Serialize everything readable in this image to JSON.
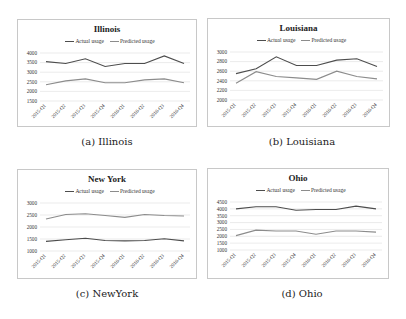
{
  "captions": {
    "a": "(a) Illinois",
    "b": "(b) Louisiana",
    "c": "(c) NewYork",
    "d": "(d) Ohio"
  },
  "legend": {
    "actual": "Actual usage",
    "predicted": "Predicted usage"
  },
  "colors": {
    "actual": "#4d4d4d",
    "predicted": "#8c8c8c",
    "grid": "#dddddd",
    "border": "#c8c8c8"
  },
  "chart_data": [
    {
      "type": "line",
      "title": "Illinois",
      "categories": [
        "2015-Q1",
        "2015-Q2",
        "2015-Q3",
        "2015-Q4",
        "2016-Q1",
        "2016-Q2",
        "2016-Q3",
        "2016-Q4"
      ],
      "series": [
        {
          "name": "Actual usage",
          "values": [
            3550,
            3450,
            3700,
            3300,
            3450,
            3450,
            3850,
            3450
          ]
        },
        {
          "name": "Predicted usage",
          "values": [
            2350,
            2550,
            2650,
            2450,
            2450,
            2600,
            2650,
            2450
          ]
        }
      ],
      "yticks": [
        1500,
        2000,
        2500,
        3000,
        3500,
        4000
      ],
      "ylim": [
        1500,
        4000
      ],
      "xlabel": "",
      "ylabel": "",
      "grid": true,
      "legend_position": "top"
    },
    {
      "type": "line",
      "title": "Louisiana",
      "categories": [
        "2015-Q1",
        "2015-Q2",
        "2015-Q3",
        "2015-Q4",
        "2016-Q1",
        "2016-Q2",
        "2016-Q3",
        "2016-Q4"
      ],
      "series": [
        {
          "name": "Actual usage",
          "values": [
            2550,
            2650,
            2900,
            2720,
            2720,
            2830,
            2860,
            2700
          ]
        },
        {
          "name": "Predicted usage",
          "values": [
            2350,
            2590,
            2490,
            2460,
            2430,
            2600,
            2490,
            2440
          ]
        }
      ],
      "yticks": [
        2000,
        2200,
        2400,
        2600,
        2800,
        3000
      ],
      "ylim": [
        2000,
        3000
      ],
      "xlabel": "",
      "ylabel": "",
      "grid": true,
      "legend_position": "top"
    },
    {
      "type": "line",
      "title": "New York",
      "categories": [
        "2015-Q1",
        "2015-Q2",
        "2015-Q3",
        "2015-Q4",
        "2016-Q1",
        "2016-Q2",
        "2016-Q3",
        "2016-Q4"
      ],
      "series": [
        {
          "name": "Actual usage",
          "values": [
            1400,
            1470,
            1530,
            1440,
            1420,
            1440,
            1510,
            1420
          ]
        },
        {
          "name": "Predicted usage",
          "values": [
            2330,
            2520,
            2550,
            2480,
            2400,
            2520,
            2480,
            2460
          ]
        }
      ],
      "yticks": [
        1000,
        1500,
        2000,
        2500,
        3000
      ],
      "ylim": [
        1000,
        3000
      ],
      "xlabel": "",
      "ylabel": "",
      "grid": true,
      "legend_position": "top"
    },
    {
      "type": "line",
      "title": "Ohio",
      "categories": [
        "2015-Q1",
        "2015-Q2",
        "2015-Q3",
        "2015-Q4",
        "2016-Q1",
        "2016-Q2",
        "2016-Q3",
        "2016-Q4"
      ],
      "series": [
        {
          "name": "Actual usage",
          "values": [
            4000,
            4150,
            4150,
            3900,
            3950,
            3950,
            4200,
            4000
          ]
        },
        {
          "name": "Predicted usage",
          "values": [
            2050,
            2450,
            2380,
            2380,
            2150,
            2380,
            2380,
            2300
          ]
        }
      ],
      "yticks": [
        1000,
        1500,
        2000,
        2500,
        3000,
        3500,
        4000,
        4500
      ],
      "ylim": [
        1000,
        4500
      ],
      "xlabel": "",
      "ylabel": "",
      "grid": true,
      "legend_position": "top"
    }
  ]
}
